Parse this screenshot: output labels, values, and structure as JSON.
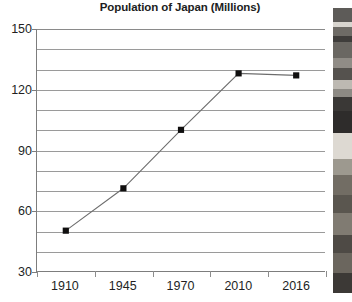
{
  "chart_data": {
    "type": "line",
    "title": "Population of Japan (Millions)",
    "xlabel": "",
    "ylabel": "",
    "categories": [
      "1910",
      "1945",
      "1970",
      "2010",
      "2016"
    ],
    "values": [
      50,
      71,
      100,
      128,
      127
    ],
    "series": [
      {
        "name": "Population of Japan",
        "values": [
          50,
          71,
          100,
          128,
          127
        ]
      }
    ],
    "ylim": [
      30,
      150
    ],
    "ytick_labels": [
      "150",
      "120",
      "90",
      "60",
      "30"
    ],
    "ytick_values": [
      150,
      120,
      90,
      60,
      30
    ],
    "minor_gridline_values": [
      150,
      140,
      130,
      120,
      110,
      100,
      90,
      80,
      70,
      60,
      50,
      40,
      30
    ],
    "grid": true,
    "legend": "none",
    "marker": "square",
    "marker_color": "#100f0f",
    "line_color": "#6d6d6d",
    "gridline_color": "#9a9a9a",
    "axis_color": "#7d7d7d",
    "text_color": "#231f1f"
  },
  "photo_strip": {
    "description": "grayscale-photo-fragment",
    "bands": [
      {
        "top": 0,
        "height": 14,
        "color": "#5d5b58"
      },
      {
        "top": 14,
        "height": 5,
        "color": "#d8d5cf"
      },
      {
        "top": 19,
        "height": 9,
        "color": "#6e6b66"
      },
      {
        "top": 28,
        "height": 6,
        "color": "#3f3d3b"
      },
      {
        "top": 34,
        "height": 16,
        "color": "#6a6762"
      },
      {
        "top": 50,
        "height": 10,
        "color": "#908c86"
      },
      {
        "top": 60,
        "height": 12,
        "color": "#55524e"
      },
      {
        "top": 72,
        "height": 9,
        "color": "#bdb9b2"
      },
      {
        "top": 81,
        "height": 8,
        "color": "#8d8a84"
      },
      {
        "top": 89,
        "height": 14,
        "color": "#3a3836"
      },
      {
        "top": 103,
        "height": 22,
        "color": "#2e2c2b"
      },
      {
        "top": 125,
        "height": 26,
        "color": "#ddd9d2"
      },
      {
        "top": 151,
        "height": 16,
        "color": "#9d998f"
      },
      {
        "top": 167,
        "height": 20,
        "color": "#726d64"
      },
      {
        "top": 187,
        "height": 18,
        "color": "#5a564f"
      },
      {
        "top": 205,
        "height": 22,
        "color": "#807b72"
      },
      {
        "top": 227,
        "height": 18,
        "color": "#4e4a45"
      },
      {
        "top": 245,
        "height": 20,
        "color": "#6b665e"
      },
      {
        "top": 265,
        "height": 20,
        "color": "#3c3936"
      }
    ]
  }
}
